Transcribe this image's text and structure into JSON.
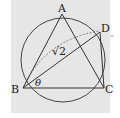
{
  "diagram": {
    "points": {
      "A": {
        "label": "A",
        "x": 62,
        "y": 14
      },
      "B": {
        "label": "B",
        "x": 23,
        "y": 88
      },
      "C": {
        "label": "C",
        "x": 104,
        "y": 88
      },
      "D": {
        "label": "D",
        "x": 100,
        "y": 32
      }
    },
    "circle": {
      "cx": 63,
      "cy": 60,
      "r": 42
    },
    "labels": {
      "A": "A",
      "B": "B",
      "C": "C",
      "D": "D",
      "length_BD": "√2",
      "angle": "θ"
    },
    "colors": {
      "panel": "#e6e6e6",
      "stroke": "#333333"
    }
  }
}
